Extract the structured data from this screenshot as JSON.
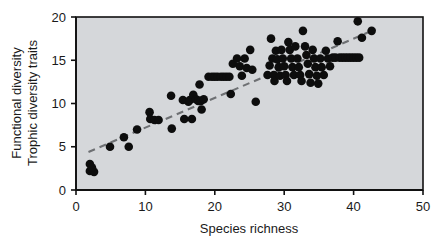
{
  "chart_data": {
    "type": "scatter",
    "title": "",
    "xlabel": "Species richness",
    "ylabel_line1": "Functional diversity",
    "ylabel_line2": "Trophic diversity traits",
    "xlim": [
      0,
      50
    ],
    "ylim": [
      0,
      20
    ],
    "xticks": [
      "0",
      "10",
      "20",
      "30",
      "40",
      "50"
    ],
    "xtick_values": [
      0,
      10,
      20,
      30,
      40,
      50
    ],
    "yticks": [
      "0",
      "5",
      "10",
      "15",
      "20"
    ],
    "ytick_values": [
      0,
      5,
      10,
      15,
      20
    ],
    "grid": false,
    "legend": "none",
    "plot_background_color": "#d5d7da",
    "point_color": "#0d0d0d",
    "point_marker": "filled-circle",
    "trendline": {
      "style": "dashed",
      "color": "#6e7073",
      "x_start": 1.8,
      "y_start": 4.4,
      "x_end": 43.2,
      "y_end": 18.6
    },
    "points": [
      [
        2.0,
        3.0
      ],
      [
        2.0,
        2.2
      ],
      [
        2.6,
        2.1
      ],
      [
        2.3,
        2.6
      ],
      [
        4.9,
        5.0
      ],
      [
        6.9,
        6.1
      ],
      [
        7.6,
        5.0
      ],
      [
        8.8,
        7.0
      ],
      [
        10.6,
        9.0
      ],
      [
        10.7,
        8.2
      ],
      [
        11.3,
        8.1
      ],
      [
        11.9,
        8.1
      ],
      [
        13.7,
        10.9
      ],
      [
        13.8,
        7.1
      ],
      [
        15.4,
        10.4
      ],
      [
        15.6,
        8.2
      ],
      [
        16.2,
        10.2
      ],
      [
        16.4,
        10.4
      ],
      [
        16.7,
        8.2
      ],
      [
        16.9,
        11.0
      ],
      [
        17.3,
        10.5
      ],
      [
        17.6,
        10.3
      ],
      [
        17.8,
        12.2
      ],
      [
        18.0,
        10.3
      ],
      [
        18.1,
        9.3
      ],
      [
        18.4,
        10.5
      ],
      [
        19.1,
        13.1
      ],
      [
        19.6,
        13.1
      ],
      [
        20.0,
        13.1
      ],
      [
        20.4,
        13.1
      ],
      [
        20.9,
        13.1
      ],
      [
        21.3,
        13.1
      ],
      [
        21.7,
        13.1
      ],
      [
        22.1,
        13.1
      ],
      [
        22.3,
        11.1
      ],
      [
        22.6,
        14.6
      ],
      [
        23.2,
        15.2
      ],
      [
        23.6,
        14.3
      ],
      [
        23.9,
        13.2
      ],
      [
        24.3,
        15.2
      ],
      [
        24.6,
        14.1
      ],
      [
        25.1,
        16.2
      ],
      [
        25.4,
        13.9
      ],
      [
        25.9,
        10.2
      ],
      [
        27.6,
        13.3
      ],
      [
        27.9,
        14.4
      ],
      [
        28.1,
        17.5
      ],
      [
        28.3,
        15.2
      ],
      [
        28.5,
        13.3
      ],
      [
        28.6,
        12.6
      ],
      [
        28.8,
        16.1
      ],
      [
        29.0,
        15.1
      ],
      [
        29.2,
        14.2
      ],
      [
        29.4,
        13.2
      ],
      [
        29.6,
        16.2
      ],
      [
        29.8,
        15.2
      ],
      [
        30.0,
        14.3
      ],
      [
        30.2,
        13.3
      ],
      [
        30.4,
        12.6
      ],
      [
        30.6,
        17.1
      ],
      [
        30.8,
        16.2
      ],
      [
        31.0,
        15.2
      ],
      [
        31.2,
        14.2
      ],
      [
        31.4,
        13.3
      ],
      [
        31.6,
        16.6
      ],
      [
        31.9,
        15.2
      ],
      [
        32.1,
        14.2
      ],
      [
        32.3,
        13.3
      ],
      [
        32.5,
        12.6
      ],
      [
        32.7,
        18.4
      ],
      [
        33.0,
        16.6
      ],
      [
        33.2,
        15.6
      ],
      [
        33.4,
        14.6
      ],
      [
        33.6,
        13.4
      ],
      [
        33.8,
        12.4
      ],
      [
        34.1,
        16.2
      ],
      [
        34.3,
        15.2
      ],
      [
        34.5,
        14.2
      ],
      [
        34.7,
        13.2
      ],
      [
        34.9,
        12.3
      ],
      [
        35.2,
        15.2
      ],
      [
        35.4,
        14.2
      ],
      [
        35.7,
        13.3
      ],
      [
        36.0,
        16.1
      ],
      [
        36.3,
        15.2
      ],
      [
        36.6,
        14.3
      ],
      [
        37.0,
        15.3
      ],
      [
        37.4,
        15.3
      ],
      [
        37.7,
        17.2
      ],
      [
        38.0,
        15.3
      ],
      [
        38.4,
        15.3
      ],
      [
        38.8,
        15.3
      ],
      [
        39.2,
        15.3
      ],
      [
        39.6,
        15.3
      ],
      [
        40.0,
        15.3
      ],
      [
        40.4,
        15.3
      ],
      [
        40.6,
        19.5
      ],
      [
        40.8,
        15.3
      ],
      [
        41.2,
        17.6
      ],
      [
        42.6,
        18.4
      ]
    ]
  }
}
